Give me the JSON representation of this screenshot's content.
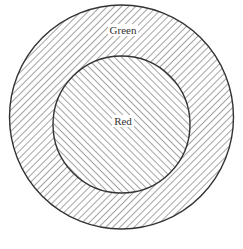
{
  "diagram": {
    "type": "concentric-circles",
    "outer_region": {
      "label": "Green",
      "hatch_direction": "backslash",
      "center": [
        121.5,
        117
      ],
      "radius": 112
    },
    "inner_region": {
      "label": "Red",
      "hatch_direction": "slash",
      "center": [
        121.5,
        124.5
      ],
      "radius": 68.5
    },
    "colors": {
      "stroke": "#333333",
      "hatch": "#555555",
      "background": "#ffffff"
    }
  }
}
